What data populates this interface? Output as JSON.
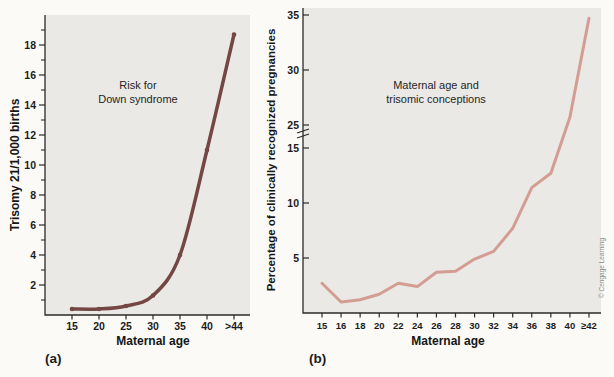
{
  "figure": {
    "panel_a_label": "(a)",
    "panel_b_label": "(b)",
    "credit": "© Cengage Learning"
  },
  "colors": {
    "page_bg": "#fbfaf7",
    "panel_bg": "#eae9e5",
    "axis": "#2b2b2b",
    "text": "#161616",
    "curve_a": "#744744",
    "curve_b": "#d39d94",
    "credit": "#8a8a8a"
  },
  "chart_data": [
    {
      "id": "down-syndrome-risk",
      "type": "line",
      "title_lines": [
        "Risk for",
        "Down syndrome"
      ],
      "xlabel": "Maternal age",
      "ylabel": "Trisomy 21/1,000 births",
      "categories": [
        "15",
        "20",
        "25",
        "30",
        "35",
        "40",
        ">44"
      ],
      "values": [
        0.4,
        0.4,
        0.6,
        1.3,
        4,
        11,
        18.7
      ],
      "ylim": [
        0,
        20
      ],
      "yticks": [
        2,
        4,
        6,
        8,
        10,
        12,
        14,
        16,
        18
      ],
      "yminor": [
        1,
        3,
        5,
        7,
        9,
        11,
        13,
        15,
        17,
        19
      ],
      "grid": false,
      "legend": "none",
      "smooth": true,
      "markers": true
    },
    {
      "id": "trisomic-conceptions",
      "type": "line",
      "title_lines": [
        "Maternal age and",
        "trisomic conceptions"
      ],
      "xlabel": "Maternal age",
      "ylabel": "Percentage of clinically recognized pregnancies",
      "categories": [
        "15",
        "16",
        "18",
        "20",
        "22",
        "24",
        "26",
        "28",
        "30",
        "32",
        "34",
        "36",
        "38",
        "40",
        "≥42"
      ],
      "values": [
        2.7,
        1.0,
        1.2,
        1.7,
        2.7,
        2.4,
        3.7,
        3.8,
        4.9,
        5.6,
        7.7,
        11.4,
        12.7,
        25.7,
        34.7
      ],
      "ylim": [
        0,
        35
      ],
      "yticks": [
        5,
        10,
        15,
        25,
        30,
        35
      ],
      "axis_break": {
        "between": [
          15,
          25
        ]
      },
      "grid": false,
      "legend": "none",
      "smooth": false,
      "markers": false
    }
  ]
}
